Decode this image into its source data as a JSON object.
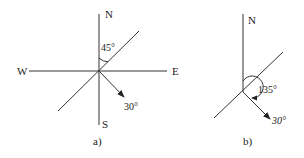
{
  "figure_a": {
    "caption": "a)",
    "labels": {
      "north": "N",
      "south": "S",
      "east": "E",
      "west": "W"
    },
    "angle_from_north": "45°",
    "vector_angle": "30°"
  },
  "figure_b": {
    "caption": "b)",
    "labels": {
      "north": "N"
    },
    "angle_from_north": "135°",
    "vector_angle": "30°"
  }
}
